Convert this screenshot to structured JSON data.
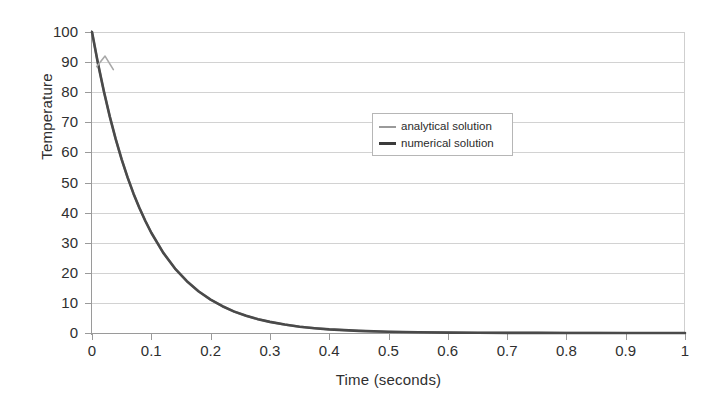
{
  "chart_data": {
    "type": "line",
    "title": "",
    "xlabel": "Time (seconds)",
    "ylabel": "Temperature",
    "xlim": [
      0,
      1
    ],
    "ylim": [
      0,
      100
    ],
    "grid": true,
    "grid_axis": "y",
    "legend_position": "upper-center",
    "xticks": [
      "0",
      "0.1",
      "0.2",
      "0.3",
      "0.4",
      "0.5",
      "0.6",
      "0.7",
      "0.8",
      "0.9",
      "1"
    ],
    "xtick_values": [
      0,
      0.1,
      0.2,
      0.3,
      0.4,
      0.5,
      0.6,
      0.7,
      0.8,
      0.9,
      1
    ],
    "yticks": [
      "0",
      "10",
      "20",
      "30",
      "40",
      "50",
      "60",
      "70",
      "80",
      "90",
      "100"
    ],
    "ytick_values": [
      0,
      10,
      20,
      30,
      40,
      50,
      60,
      70,
      80,
      90,
      100
    ],
    "x": [
      0,
      0.01,
      0.02,
      0.03,
      0.04,
      0.05,
      0.06,
      0.07,
      0.08,
      0.09,
      0.1,
      0.12,
      0.14,
      0.16,
      0.18,
      0.2,
      0.22,
      0.24,
      0.26,
      0.28,
      0.3,
      0.325,
      0.35,
      0.375,
      0.4,
      0.45,
      0.5,
      0.55,
      0.6,
      0.65,
      0.7,
      0.75,
      0.8,
      0.85,
      0.9,
      0.95,
      1
    ],
    "series": [
      {
        "name": "analytical solution",
        "color": "#9a9a9a",
        "width": 2.2,
        "values": [
          100,
          89.6,
          80.3,
          71.9,
          64.4,
          57.7,
          51.7,
          46.3,
          41.5,
          37.2,
          33.3,
          26.7,
          21.4,
          17.2,
          13.8,
          11.1,
          8.9,
          7.1,
          5.7,
          4.6,
          3.7,
          2.8,
          2.1,
          1.6,
          1.2,
          0.7,
          0.4,
          0.24,
          0.14,
          0.08,
          0.045,
          0.026,
          0.015,
          0.009,
          0.005,
          0.003,
          0.0017
        ]
      },
      {
        "name": "numerical solution",
        "color": "#4a4a4a",
        "width": 2.6,
        "values": [
          100,
          89.6,
          80.3,
          71.9,
          64.4,
          57.7,
          51.7,
          46.3,
          41.5,
          37.2,
          33.3,
          26.7,
          21.4,
          17.2,
          13.8,
          11.1,
          8.9,
          7.1,
          5.7,
          4.6,
          3.7,
          2.8,
          2.1,
          1.6,
          1.2,
          0.7,
          0.4,
          0.24,
          0.14,
          0.08,
          0.045,
          0.026,
          0.015,
          0.009,
          0.005,
          0.003,
          0.0017
        ]
      }
    ],
    "artifact": {
      "description": "small grey spike on analytical curve near start",
      "x": [
        0.008,
        0.022,
        0.036
      ],
      "values": [
        88.5,
        92.0,
        87.5
      ],
      "color": "#a8a8a8"
    }
  },
  "legend": {
    "entries": [
      {
        "label": "analytical solution",
        "color": "#9a9a9a",
        "thickness": "2px"
      },
      {
        "label": "numerical solution",
        "color": "#3b3b3b",
        "thickness": "3px"
      }
    ]
  }
}
